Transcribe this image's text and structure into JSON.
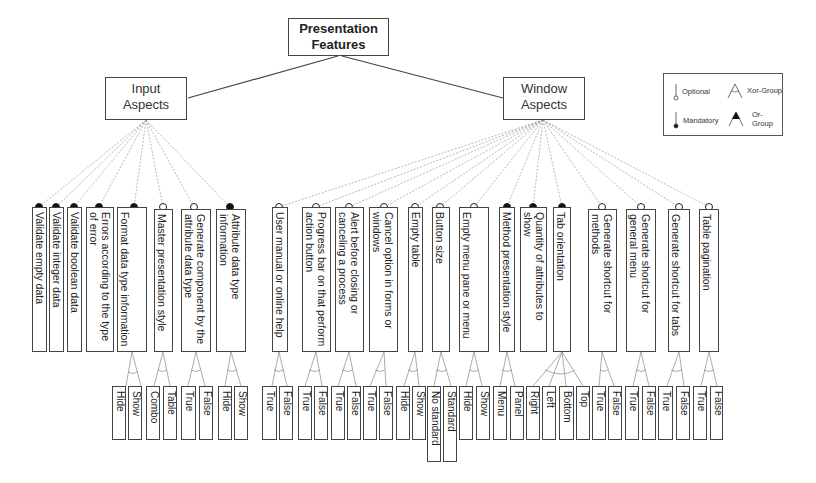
{
  "root": {
    "label_line1": "Presentation",
    "label_line2": "Features"
  },
  "groups": [
    {
      "id": "input",
      "label_line1": "Input",
      "label_line2": "Aspects"
    },
    {
      "id": "window",
      "label_line1": "Window",
      "label_line2": "Aspects"
    }
  ],
  "legend": {
    "optional": "Optional",
    "mandatory": "Mandatory",
    "xor_group": "Xor-Group",
    "or_group": "Or-Group"
  },
  "features": [
    {
      "label": "Validate empty data",
      "type": "mandatory",
      "parent": "input"
    },
    {
      "label": "Validate integer data",
      "type": "mandatory",
      "parent": "input"
    },
    {
      "label": "Validate boolean data",
      "type": "mandatory",
      "parent": "input"
    },
    {
      "label": "Errors according to the type of error",
      "type": "mandatory",
      "parent": "input"
    },
    {
      "label": "Format data type information",
      "type": "mandatory",
      "parent": "input",
      "children": [
        "Hide",
        "Show"
      ],
      "group": "xor"
    },
    {
      "label": "Master presentation style",
      "type": "optional",
      "parent": "input",
      "children": [
        "Combo",
        "Table"
      ],
      "group": "xor"
    },
    {
      "label": "Generate component by the attribute data type",
      "type": "optional",
      "parent": "input",
      "children": [
        "True",
        "False"
      ],
      "group": "xor"
    },
    {
      "label": "Attribute data type information",
      "type": "mandatory",
      "parent": "input",
      "children": [
        "Hide",
        "Show"
      ],
      "group": "xor"
    },
    {
      "label": "User manual or online help",
      "type": "optional",
      "parent": "window",
      "children": [
        "True",
        "False"
      ],
      "group": "xor"
    },
    {
      "label": "Progress bar on that perform action button",
      "type": "optional",
      "parent": "window",
      "children": [
        "True",
        "False"
      ],
      "group": "xor"
    },
    {
      "label": "Alert before closing or canceling a process",
      "type": "optional",
      "parent": "window",
      "children": [
        "True",
        "False"
      ],
      "group": "xor"
    },
    {
      "label": "Cancel option in forms or windows",
      "type": "optional",
      "parent": "window",
      "children": [
        "True",
        "False"
      ],
      "group": "xor"
    },
    {
      "label": "Empty table",
      "type": "optional",
      "parent": "window",
      "children": [
        "Hide",
        "Show"
      ],
      "group": "xor"
    },
    {
      "label": "Button size",
      "type": "optional",
      "parent": "window",
      "children": [
        "No standard",
        "Standard"
      ],
      "group": "xor"
    },
    {
      "label": "Empty menu pane or menu",
      "type": "optional",
      "parent": "window",
      "children": [
        "Hide",
        "Show"
      ],
      "group": "xor"
    },
    {
      "label": "Method presentation style",
      "type": "mandatory",
      "parent": "window",
      "children": [
        "Menu",
        "Panel"
      ],
      "group": "xor"
    },
    {
      "label": "Quantity of attributes to show",
      "type": "mandatory",
      "parent": "window"
    },
    {
      "label": "Tab orientation",
      "type": "mandatory",
      "parent": "window",
      "children": [
        "Right",
        "Left",
        "Bottom",
        "Top"
      ],
      "group": "xor"
    },
    {
      "label": "Generate shortcut for methods",
      "type": "optional",
      "parent": "window",
      "children": [
        "True",
        "False"
      ],
      "group": "xor"
    },
    {
      "label": "Generate shortcut for general menu",
      "type": "optional",
      "parent": "window",
      "children": [
        "True",
        "False"
      ],
      "group": "xor"
    },
    {
      "label": "Generate shortcut for tabs",
      "type": "optional",
      "parent": "window",
      "children": [
        "True",
        "False"
      ],
      "group": "xor"
    },
    {
      "label": "Table pagination",
      "type": "optional",
      "parent": "window",
      "children": [
        "True",
        "False"
      ],
      "group": "xor"
    }
  ],
  "leaves": [
    "Hide",
    "Show",
    "Combo",
    "Table",
    "True",
    "False",
    "Hide",
    "Show",
    "True",
    "False",
    "True",
    "False",
    "True",
    "False",
    "True",
    "False",
    "Hide",
    "Show",
    "No standard",
    "Standard",
    "Hide",
    "Show",
    "Menu",
    "Panel",
    "Right",
    "Left",
    "Bottom",
    "Top",
    "True",
    "False",
    "True",
    "False",
    "True",
    "False",
    "True",
    "False"
  ]
}
